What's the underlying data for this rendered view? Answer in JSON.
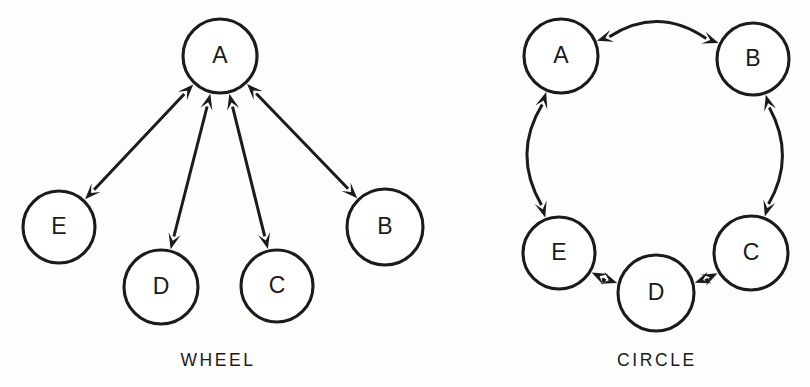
{
  "figure": {
    "background_color": "#fdfdfc",
    "stroke_color": "#1b1b1b",
    "node_fill_color": "#ffffff"
  },
  "panels": [
    {
      "id": "wheel",
      "caption": "WHEEL",
      "caption_x": 218,
      "caption_y": 366,
      "nodes": [
        {
          "id": "A",
          "label": "A",
          "cx": 220,
          "cy": 56,
          "r": 37
        },
        {
          "id": "E",
          "label": "E",
          "cx": 59,
          "cy": 227,
          "r": 36
        },
        {
          "id": "D",
          "label": "D",
          "cx": 161,
          "cy": 287,
          "r": 37
        },
        {
          "id": "C",
          "label": "C",
          "cx": 277,
          "cy": 286,
          "r": 36
        },
        {
          "id": "B",
          "label": "B",
          "cx": 385,
          "cy": 227,
          "r": 38
        }
      ],
      "edges": [
        {
          "from": "A",
          "to": "E",
          "shape": "straight",
          "direction": "both"
        },
        {
          "from": "A",
          "to": "D",
          "shape": "straight",
          "direction": "both"
        },
        {
          "from": "A",
          "to": "C",
          "shape": "straight",
          "direction": "both"
        },
        {
          "from": "A",
          "to": "B",
          "shape": "straight",
          "direction": "both"
        }
      ]
    },
    {
      "id": "circle",
      "caption": "CIRCLE",
      "caption_x": 657,
      "caption_y": 366,
      "nodes": [
        {
          "id": "A",
          "label": "A",
          "cx": 561,
          "cy": 56,
          "r": 37
        },
        {
          "id": "B",
          "label": "B",
          "cx": 753,
          "cy": 59,
          "r": 36
        },
        {
          "id": "C",
          "label": "C",
          "cx": 751,
          "cy": 253,
          "r": 37
        },
        {
          "id": "D",
          "label": "D",
          "cx": 656,
          "cy": 293,
          "r": 38
        },
        {
          "id": "E",
          "label": "E",
          "cx": 559,
          "cy": 253,
          "r": 36
        }
      ],
      "edges": [
        {
          "from": "A",
          "to": "B",
          "shape": "curved",
          "direction": "both",
          "bow": -26
        },
        {
          "from": "B",
          "to": "C",
          "shape": "curved",
          "direction": "both",
          "bow": -22
        },
        {
          "from": "C",
          "to": "D",
          "shape": "curved",
          "direction": "both",
          "bow": -6
        },
        {
          "from": "D",
          "to": "E",
          "shape": "curved",
          "direction": "both",
          "bow": -6
        },
        {
          "from": "E",
          "to": "A",
          "shape": "curved",
          "direction": "both",
          "bow": -24
        }
      ]
    }
  ],
  "chart_data": {
    "type": "diagram",
    "title": "",
    "subtitle": "",
    "diagram_kind": "graph-topology-comparison",
    "graphs": [
      {
        "name": "WHEEL",
        "vertices": [
          "A",
          "B",
          "C",
          "D",
          "E"
        ],
        "hub": "A",
        "edges": [
          [
            "A",
            "E"
          ],
          [
            "A",
            "D"
          ],
          [
            "A",
            "C"
          ],
          [
            "A",
            "B"
          ]
        ],
        "edge_count": 4,
        "bidirectional": true
      },
      {
        "name": "CIRCLE",
        "vertices": [
          "A",
          "B",
          "C",
          "D",
          "E"
        ],
        "hub": null,
        "edges": [
          [
            "A",
            "B"
          ],
          [
            "B",
            "C"
          ],
          [
            "C",
            "D"
          ],
          [
            "D",
            "E"
          ],
          [
            "E",
            "A"
          ]
        ],
        "edge_count": 5,
        "bidirectional": true
      }
    ]
  }
}
